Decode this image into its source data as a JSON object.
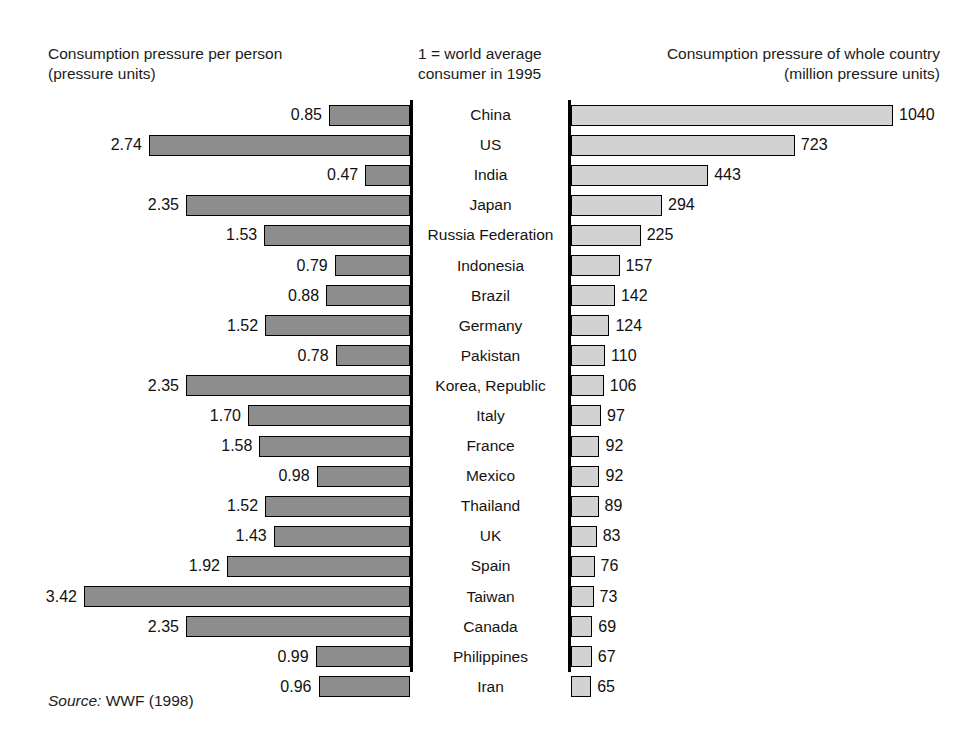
{
  "headers": {
    "left": "Consumption pressure per person\n(pressure units)",
    "middle": "1 = world average\nconsumer in 1995",
    "right": "Consumption pressure of whole country\n(million pressure units)"
  },
  "source": {
    "label": "Source:",
    "text": " WWF (1998)"
  },
  "colors": {
    "bar_left_fill": "#8d8d8d",
    "bar_right_fill": "#d2d2d2",
    "bar_stroke": "#000000",
    "text": "#1a1a1a",
    "background": "#ffffff"
  },
  "chart_data": {
    "type": "bar",
    "title": "",
    "orientation": "horizontal",
    "layout": "paired back-to-back (butterfly) bar chart",
    "categories": [
      "China",
      "US",
      "India",
      "Japan",
      "Russia Federation",
      "Indonesia",
      "Brazil",
      "Germany",
      "Pakistan",
      "Korea, Republic",
      "Italy",
      "France",
      "Mexico",
      "Thailand",
      "UK",
      "Spain",
      "Taiwan",
      "Canada",
      "Philippines",
      "Iran"
    ],
    "series": [
      {
        "name": "Consumption pressure per person",
        "side": "left",
        "unit": "pressure units",
        "note": "1 = world average consumer in 1995",
        "axis_direction": "right-to-left",
        "max_value": 3.42,
        "values": [
          0.85,
          2.74,
          0.47,
          2.35,
          1.53,
          0.79,
          0.88,
          1.52,
          0.78,
          2.35,
          1.7,
          1.58,
          0.98,
          1.52,
          1.43,
          1.92,
          3.42,
          2.35,
          0.99,
          0.96
        ],
        "labels": [
          "0.85",
          "2.74",
          "0.47",
          "2.35",
          "1.53",
          "0.79",
          "0.88",
          "1.52",
          "0.78",
          "2.35",
          "1.70",
          "1.58",
          "0.98",
          "1.52",
          "1.43",
          "1.92",
          "3.42",
          "2.35",
          "0.99",
          "0.96"
        ]
      },
      {
        "name": "Consumption pressure of whole country",
        "side": "right",
        "unit": "million pressure units",
        "axis_direction": "left-to-right",
        "max_value": 1040,
        "values": [
          1040,
          723,
          443,
          294,
          225,
          157,
          142,
          124,
          110,
          106,
          97,
          92,
          92,
          89,
          83,
          76,
          73,
          69,
          67,
          65
        ],
        "labels": [
          "1040",
          "723",
          "443",
          "294",
          "225",
          "157",
          "142",
          "124",
          "110",
          "106",
          "97",
          "92",
          "92",
          "89",
          "83",
          "76",
          "73",
          "69",
          "67",
          "65"
        ]
      }
    ],
    "xlabel": "",
    "ylabel": "",
    "grid": false,
    "legend": false,
    "source": "WWF (1998)"
  }
}
